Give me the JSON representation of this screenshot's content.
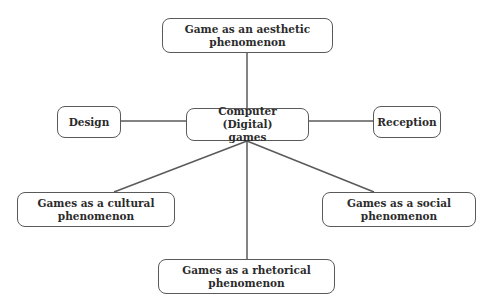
{
  "diagram": {
    "type": "concept-map",
    "center": {
      "id": "center",
      "label_line1": "Computer (Digital)",
      "label_line2": "games"
    },
    "nodes": [
      {
        "id": "aesthetic",
        "label_line1": "Game as an aesthetic",
        "label_line2": "phenomenon"
      },
      {
        "id": "design",
        "label_line1": "Design",
        "label_line2": ""
      },
      {
        "id": "reception",
        "label_line1": "Reception",
        "label_line2": ""
      },
      {
        "id": "cultural",
        "label_line1": "Games as a cultural",
        "label_line2": "phenomenon"
      },
      {
        "id": "social",
        "label_line1": "Games as a social",
        "label_line2": "phenomenon"
      },
      {
        "id": "rhetorical",
        "label_line1": "Games as a rhetorical",
        "label_line2": "phenomenon"
      }
    ],
    "edges": [
      {
        "from": "center",
        "to": "aesthetic"
      },
      {
        "from": "center",
        "to": "design"
      },
      {
        "from": "center",
        "to": "reception"
      },
      {
        "from": "center",
        "to": "cultural"
      },
      {
        "from": "center",
        "to": "social"
      },
      {
        "from": "center",
        "to": "rhetorical"
      }
    ],
    "colors": {
      "stroke": "#5a5a5a",
      "text": "#2b2b2b",
      "background": "#ffffff"
    }
  }
}
